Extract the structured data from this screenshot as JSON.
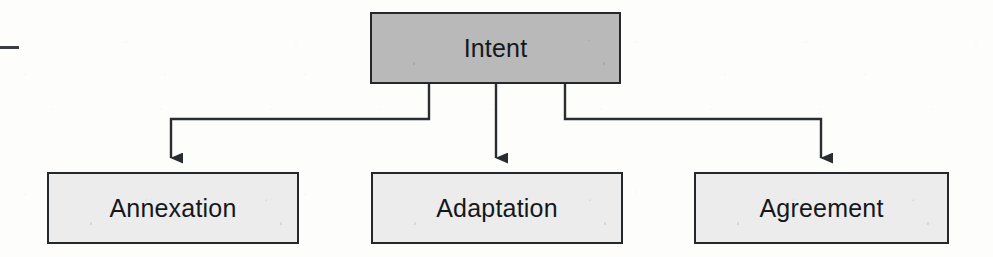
{
  "diagram": {
    "type": "tree",
    "orientation": "top-down",
    "root": {
      "id": "intent",
      "label": "Intent",
      "fill": "#b9b9b9",
      "stroke": "#25282b",
      "x": 370,
      "y": 12,
      "width": 251,
      "height": 72
    },
    "children": [
      {
        "id": "annexation",
        "label": "Annexation",
        "fill": "#ececec",
        "stroke": "#25282b",
        "x": 47,
        "y": 172,
        "width": 252,
        "height": 72
      },
      {
        "id": "adaptation",
        "label": "Adaptation",
        "fill": "#ececec",
        "stroke": "#25282b",
        "x": 371,
        "y": 172,
        "width": 252,
        "height": 72
      },
      {
        "id": "agreement",
        "label": "Agreement",
        "fill": "#ececec",
        "stroke": "#25282b",
        "x": 694,
        "y": 172,
        "width": 255,
        "height": 72
      }
    ],
    "edges": [
      {
        "id": "edge-intent-annexation",
        "from": "intent",
        "to": "annexation",
        "style": "orthogonal",
        "arrow": "filled-triangle"
      },
      {
        "id": "edge-intent-adaptation",
        "from": "intent",
        "to": "adaptation",
        "style": "straight",
        "arrow": "filled-triangle"
      },
      {
        "id": "edge-intent-agreement",
        "from": "intent",
        "to": "agreement",
        "style": "orthogonal",
        "arrow": "filled-triangle"
      }
    ],
    "line_color": "#2a2d30",
    "background": "#fdfdfc"
  },
  "artifacts": {
    "left_edge_dash": "scan-artifact-dash"
  }
}
